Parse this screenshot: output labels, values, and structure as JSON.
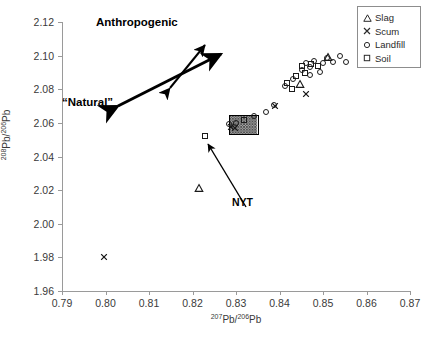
{
  "chart_data": {
    "type": "scatter",
    "title": "",
    "xlabel": "207Pb/206Pb",
    "ylabel": "208Pb/206Pb",
    "xlim": [
      0.79,
      0.87
    ],
    "ylim": [
      1.96,
      2.12
    ],
    "xticks": [
      "0.79",
      "0.80",
      "0.81",
      "0.82",
      "0.83",
      "0.84",
      "0.85",
      "0.86",
      "0.87"
    ],
    "xtick_values": [
      0.79,
      0.8,
      0.81,
      0.82,
      0.83,
      0.84,
      0.85,
      0.86,
      0.87
    ],
    "yticks": [
      "1.96",
      "1.98",
      "2.00",
      "2.02",
      "2.04",
      "2.06",
      "2.08",
      "2.10",
      "2.12"
    ],
    "ytick_values": [
      1.96,
      1.98,
      2.0,
      2.02,
      2.04,
      2.06,
      2.08,
      2.1,
      2.12
    ],
    "grid": false,
    "legend_position": "top-right",
    "series": [
      {
        "name": "Slag",
        "marker": "triangle",
        "points": [
          [
            0.8215,
            2.0215
          ],
          [
            0.8448,
            2.083
          ],
          [
            0.8512,
            2.099
          ]
        ]
      },
      {
        "name": "Scum",
        "marker": "cross",
        "points": [
          [
            0.7997,
            1.98
          ],
          [
            0.8288,
            2.0578
          ],
          [
            0.8297,
            2.0572
          ],
          [
            0.839,
            2.07
          ],
          [
            0.8462,
            2.0772
          ]
        ]
      },
      {
        "name": "Landfill",
        "marker": "circle",
        "points": [
          [
            0.8283,
            2.0592
          ],
          [
            0.83,
            2.0598
          ],
          [
            0.8342,
            2.064
          ],
          [
            0.8368,
            2.0662
          ],
          [
            0.8388,
            2.0705
          ],
          [
            0.8432,
            2.0858
          ],
          [
            0.8452,
            2.0912
          ],
          [
            0.8462,
            2.0958
          ],
          [
            0.847,
            2.093
          ],
          [
            0.848,
            2.0968
          ],
          [
            0.8492,
            2.0905
          ],
          [
            0.85,
            2.0958
          ],
          [
            0.851,
            2.0988
          ],
          [
            0.8522,
            2.0962
          ],
          [
            0.8538,
            2.0995
          ],
          [
            0.8552,
            2.0962
          ],
          [
            0.847,
            2.0885
          ],
          [
            0.8412,
            2.0818
          ]
        ]
      },
      {
        "name": "Soil",
        "marker": "square",
        "points": [
          [
            0.8228,
            2.052
          ],
          [
            0.8318,
            2.0618
          ],
          [
            0.8438,
            2.088
          ],
          [
            0.8452,
            2.094
          ],
          [
            0.8458,
            2.0898
          ],
          [
            0.8472,
            2.0952
          ],
          [
            0.8488,
            2.0938
          ],
          [
            0.8418,
            2.084
          ],
          [
            0.8428,
            2.08
          ]
        ]
      }
    ],
    "regions": [
      {
        "name": "NYT",
        "label": "NYT",
        "style": "hatched-rectangle",
        "x_range": [
          0.8285,
          0.8352
        ],
        "y_range": [
          2.0525,
          2.0645
        ]
      }
    ],
    "annotations": [
      {
        "name": "anthropogenic",
        "text": "Anthropogenic"
      },
      {
        "name": "natural",
        "text": "“Natural”"
      },
      {
        "name": "nyt",
        "text": "NYT"
      }
    ]
  },
  "legend": {
    "items": [
      {
        "label": "Slag",
        "symbol": "triangle-icon"
      },
      {
        "label": "Scum",
        "symbol": "cross-icon"
      },
      {
        "label": "Landfill",
        "symbol": "circle-icon"
      },
      {
        "label": "Soil",
        "symbol": "square-icon"
      }
    ]
  },
  "axis": {
    "y_label_pre": "208",
    "y_label_mid": "Pb/",
    "y_label_sup2": "206",
    "y_label_end": "Pb",
    "x_label_pre": "207",
    "x_label_mid": "Pb/",
    "x_label_sup2": "206",
    "x_label_end": "Pb"
  },
  "colors": {
    "marker": "#1a1a1a",
    "axis": "#9a9a9a",
    "text": "#3a3a3a",
    "hatch": "#555555"
  }
}
